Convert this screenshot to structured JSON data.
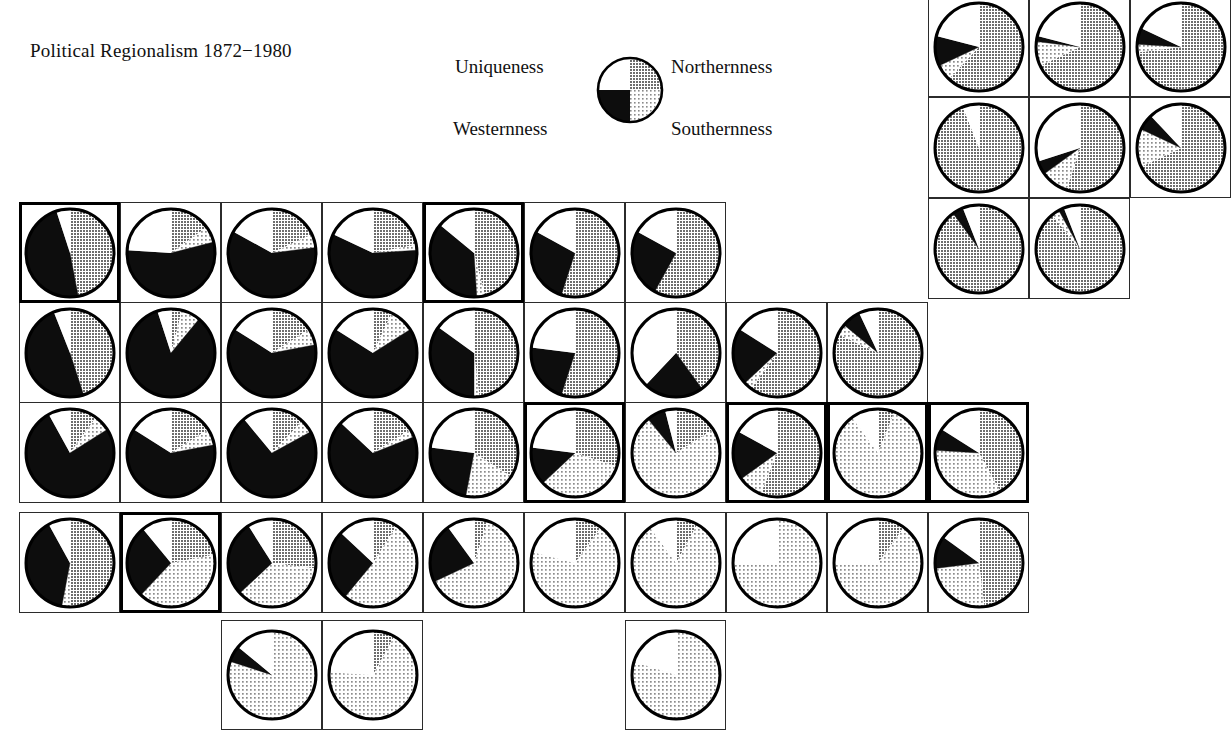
{
  "title": "Political Regionalism 1872−1980",
  "legend": {
    "uniqueness": "Uniqueness",
    "northernness": "Northernness",
    "westernness": "Westernness",
    "southernness": "Southernness",
    "quadrants": [
      {
        "name": "uniqueness",
        "pattern": "white",
        "position": "top-left"
      },
      {
        "name": "northernness",
        "pattern": "gray",
        "position": "top-right"
      },
      {
        "name": "westernness",
        "pattern": "black",
        "position": "bottom-left"
      },
      {
        "name": "southernness",
        "pattern": "stipple",
        "position": "bottom-right"
      }
    ]
  },
  "colors": {
    "uniqueness": "#ffffff",
    "northernness": "#9a9a9a",
    "westernness": "#0d0d0d",
    "southernness": "#dcdcdc",
    "outline": "#000000",
    "cell_border": "#2b2b2b",
    "background": "#ffffff"
  },
  "chart_data": {
    "type": "pie",
    "title": "Political Regionalism 1872−1980",
    "slice_order": [
      "northernness",
      "southernness",
      "westernness",
      "uniqueness"
    ],
    "series_names": [
      "Northernness",
      "Southernness",
      "Westernness",
      "Uniqueness"
    ],
    "legend_position": "top-center",
    "units": "fraction of pie (percent)",
    "grid": {
      "cols": 12,
      "rows": 7,
      "cell_px": 101
    },
    "pies": [
      {
        "id": "r1c10",
        "col": 10,
        "row": 1,
        "emphasis": false,
        "values": {
          "northernness": 62,
          "southernness": 6,
          "westernness": 11,
          "uniqueness": 21
        }
      },
      {
        "id": "r1c11",
        "col": 11,
        "row": 1,
        "emphasis": false,
        "values": {
          "northernness": 68,
          "southernness": 9,
          "westernness": 2,
          "uniqueness": 21
        }
      },
      {
        "id": "r1c12",
        "col": 12,
        "row": 1,
        "emphasis": false,
        "values": {
          "northernness": 73,
          "southernness": 3,
          "westernness": 6,
          "uniqueness": 18
        }
      },
      {
        "id": "r2c10",
        "col": 10,
        "row": 2,
        "emphasis": false,
        "values": {
          "northernness": 94,
          "southernness": 0,
          "westernness": 0,
          "uniqueness": 6
        }
      },
      {
        "id": "r2c11",
        "col": 11,
        "row": 2,
        "emphasis": false,
        "values": {
          "northernness": 55,
          "southernness": 10,
          "westernness": 5,
          "uniqueness": 30
        }
      },
      {
        "id": "r2c12",
        "col": 12,
        "row": 2,
        "emphasis": false,
        "values": {
          "northernness": 68,
          "southernness": 14,
          "westernness": 6,
          "uniqueness": 12
        }
      },
      {
        "id": "r3c10",
        "col": 10,
        "row": 3,
        "emphasis": false,
        "values": {
          "northernness": 90,
          "southernness": 0,
          "westernness": 4,
          "uniqueness": 6
        }
      },
      {
        "id": "r3c11",
        "col": 11,
        "row": 3,
        "emphasis": false,
        "values": {
          "northernness": 89,
          "southernness": 3,
          "westernness": 2,
          "uniqueness": 6
        }
      },
      {
        "id": "r4c1",
        "col": 1,
        "row": 4,
        "emphasis": true,
        "values": {
          "northernness": 47,
          "southernness": 0,
          "westernness": 48,
          "uniqueness": 5
        }
      },
      {
        "id": "r4c2",
        "col": 2,
        "row": 4,
        "emphasis": false,
        "values": {
          "northernness": 15,
          "southernness": 6,
          "westernness": 55,
          "uniqueness": 24
        }
      },
      {
        "id": "r4c3",
        "col": 3,
        "row": 4,
        "emphasis": false,
        "values": {
          "northernness": 18,
          "southernness": 5,
          "westernness": 60,
          "uniqueness": 17
        }
      },
      {
        "id": "r4c4",
        "col": 4,
        "row": 4,
        "emphasis": false,
        "values": {
          "northernness": 22,
          "southernness": 2,
          "westernness": 58,
          "uniqueness": 18
        }
      },
      {
        "id": "r4c5",
        "col": 5,
        "row": 4,
        "emphasis": true,
        "values": {
          "northernness": 46,
          "southernness": 3,
          "westernness": 37,
          "uniqueness": 14
        }
      },
      {
        "id": "r4c6",
        "col": 6,
        "row": 4,
        "emphasis": false,
        "values": {
          "northernness": 55,
          "southernness": 0,
          "westernness": 28,
          "uniqueness": 17
        }
      },
      {
        "id": "r4c7",
        "col": 7,
        "row": 4,
        "emphasis": false,
        "values": {
          "northernness": 58,
          "southernness": 0,
          "westernness": 25,
          "uniqueness": 17
        }
      },
      {
        "id": "r5c1",
        "col": 1,
        "row": 5,
        "emphasis": false,
        "values": {
          "northernness": 45,
          "southernness": 0,
          "westernness": 49,
          "uniqueness": 6
        }
      },
      {
        "id": "r5c2",
        "col": 2,
        "row": 5,
        "emphasis": false,
        "values": {
          "northernness": 4,
          "southernness": 7,
          "westernness": 84,
          "uniqueness": 5
        }
      },
      {
        "id": "r5c3",
        "col": 3,
        "row": 5,
        "emphasis": false,
        "values": {
          "northernness": 16,
          "southernness": 6,
          "westernness": 62,
          "uniqueness": 16
        }
      },
      {
        "id": "r5c4",
        "col": 4,
        "row": 5,
        "emphasis": false,
        "values": {
          "northernness": 7,
          "southernness": 9,
          "westernness": 68,
          "uniqueness": 16
        }
      },
      {
        "id": "r5c5",
        "col": 5,
        "row": 5,
        "emphasis": false,
        "values": {
          "northernness": 48,
          "southernness": 2,
          "westernness": 35,
          "uniqueness": 15
        }
      },
      {
        "id": "r5c6",
        "col": 6,
        "row": 5,
        "emphasis": false,
        "values": {
          "northernness": 55,
          "southernness": 0,
          "westernness": 22,
          "uniqueness": 23
        }
      },
      {
        "id": "r5c7",
        "col": 7,
        "row": 5,
        "emphasis": false,
        "values": {
          "northernness": 40,
          "southernness": 0,
          "westernness": 22,
          "uniqueness": 38
        }
      },
      {
        "id": "r5c8",
        "col": 8,
        "row": 5,
        "emphasis": false,
        "values": {
          "northernness": 60,
          "southernness": 3,
          "westernness": 21,
          "uniqueness": 16
        }
      },
      {
        "id": "r5c9",
        "col": 9,
        "row": 5,
        "emphasis": false,
        "values": {
          "northernness": 82,
          "southernness": 4,
          "westernness": 7,
          "uniqueness": 7
        }
      },
      {
        "id": "r6c1",
        "col": 1,
        "row": 6,
        "emphasis": false,
        "values": {
          "northernness": 10,
          "southernness": 6,
          "westernness": 76,
          "uniqueness": 8
        }
      },
      {
        "id": "r6c2",
        "col": 2,
        "row": 6,
        "emphasis": false,
        "values": {
          "northernness": 16,
          "southernness": 6,
          "westernness": 62,
          "uniqueness": 16
        }
      },
      {
        "id": "r6c3",
        "col": 3,
        "row": 6,
        "emphasis": false,
        "values": {
          "northernness": 12,
          "southernness": 5,
          "westernness": 72,
          "uniqueness": 11
        }
      },
      {
        "id": "r6c4",
        "col": 4,
        "row": 6,
        "emphasis": false,
        "values": {
          "northernness": 16,
          "southernness": 3,
          "westernness": 68,
          "uniqueness": 13
        }
      },
      {
        "id": "r6c5",
        "col": 5,
        "row": 6,
        "emphasis": false,
        "values": {
          "northernness": 34,
          "southernness": 19,
          "westernness": 24,
          "uniqueness": 23
        }
      },
      {
        "id": "r6c6",
        "col": 6,
        "row": 6,
        "emphasis": true,
        "values": {
          "northernness": 30,
          "southernness": 33,
          "westernness": 14,
          "uniqueness": 23
        }
      },
      {
        "id": "r6c7",
        "col": 7,
        "row": 6,
        "emphasis": false,
        "values": {
          "northernness": 16,
          "southernness": 73,
          "westernness": 7,
          "uniqueness": 4
        }
      },
      {
        "id": "r6c8",
        "col": 8,
        "row": 6,
        "emphasis": true,
        "values": {
          "northernness": 56,
          "southernness": 9,
          "westernness": 18,
          "uniqueness": 17
        }
      },
      {
        "id": "r6c9",
        "col": 9,
        "row": 6,
        "emphasis": true,
        "values": {
          "northernness": 6,
          "southernness": 84,
          "westernness": 0,
          "uniqueness": 10
        }
      },
      {
        "id": "r6c10",
        "col": 10,
        "row": 6,
        "emphasis": true,
        "values": {
          "northernness": 42,
          "southernness": 34,
          "westernness": 8,
          "uniqueness": 16
        }
      },
      {
        "id": "r7c1",
        "col": 1,
        "row": 7,
        "emphasis": false,
        "values": {
          "northernness": 50,
          "southernness": 3,
          "westernness": 39,
          "uniqueness": 8
        }
      },
      {
        "id": "r7c2",
        "col": 2,
        "row": 7,
        "emphasis": true,
        "values": {
          "northernness": 22,
          "southernness": 40,
          "westernness": 27,
          "uniqueness": 11
        }
      },
      {
        "id": "r7c3",
        "col": 3,
        "row": 7,
        "emphasis": false,
        "values": {
          "northernness": 27,
          "southernness": 36,
          "westernness": 28,
          "uniqueness": 9
        }
      },
      {
        "id": "r7c4",
        "col": 4,
        "row": 7,
        "emphasis": false,
        "values": {
          "northernness": 9,
          "southernness": 52,
          "westernness": 26,
          "uniqueness": 13
        }
      },
      {
        "id": "r7c5",
        "col": 5,
        "row": 7,
        "emphasis": false,
        "values": {
          "northernness": 5,
          "southernness": 63,
          "westernness": 22,
          "uniqueness": 10
        }
      },
      {
        "id": "r7c6",
        "col": 6,
        "row": 7,
        "emphasis": false,
        "values": {
          "northernness": 10,
          "southernness": 69,
          "westernness": 0,
          "uniqueness": 21
        }
      },
      {
        "id": "r7c7",
        "col": 7,
        "row": 7,
        "emphasis": false,
        "values": {
          "northernness": 8,
          "southernness": 82,
          "westernness": 0,
          "uniqueness": 10
        }
      },
      {
        "id": "r7c8",
        "col": 8,
        "row": 7,
        "emphasis": false,
        "values": {
          "northernness": 0,
          "southernness": 75,
          "westernness": 0,
          "uniqueness": 25
        }
      },
      {
        "id": "r7c9",
        "col": 9,
        "row": 7,
        "emphasis": false,
        "values": {
          "northernness": 10,
          "southernness": 65,
          "westernness": 0,
          "uniqueness": 25
        }
      },
      {
        "id": "r7c10",
        "col": 10,
        "row": 7,
        "emphasis": false,
        "values": {
          "northernness": 48,
          "southernness": 25,
          "westernness": 12,
          "uniqueness": 15
        }
      },
      {
        "id": "r8c3",
        "col": 3,
        "row": 8,
        "emphasis": false,
        "values": {
          "northernness": 0,
          "southernness": 80,
          "westernness": 6,
          "uniqueness": 14
        }
      },
      {
        "id": "r8c4",
        "col": 4,
        "row": 8,
        "emphasis": false,
        "values": {
          "northernness": 8,
          "southernness": 68,
          "westernness": 0,
          "uniqueness": 24
        }
      },
      {
        "id": "r8c7b",
        "col": 7,
        "row": 8,
        "emphasis": false,
        "values": {
          "northernness": 0,
          "southernness": 80,
          "westernness": 0,
          "uniqueness": 20
        }
      }
    ]
  }
}
